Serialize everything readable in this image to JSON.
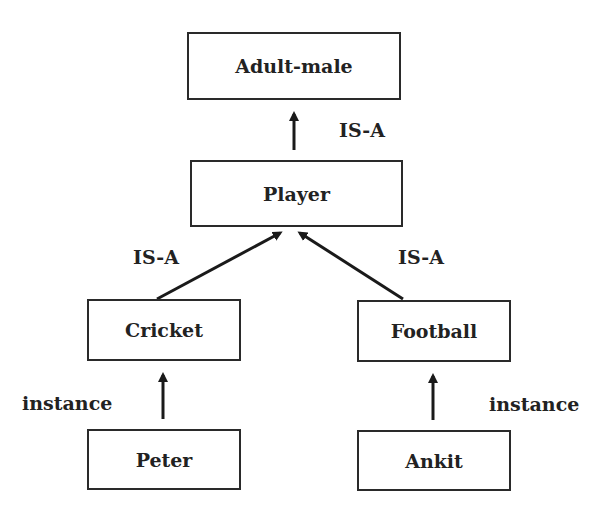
{
  "diagram": {
    "nodes": {
      "adult_male": "Adult-male",
      "player": "Player",
      "cricket": "Cricket",
      "football": "Football",
      "peter": "Peter",
      "ankit": "Ankit"
    },
    "edges": [
      {
        "from": "Player",
        "to": "Adult-male",
        "label": "IS-A"
      },
      {
        "from": "Cricket",
        "to": "Player",
        "label": "IS-A"
      },
      {
        "from": "Football",
        "to": "Player",
        "label": "IS-A"
      },
      {
        "from": "Peter",
        "to": "Cricket",
        "label": "instance"
      },
      {
        "from": "Ankit",
        "to": "Football",
        "label": "instance"
      }
    ],
    "edge_labels": {
      "player_adult": "IS-A",
      "cricket_player": "IS-A",
      "football_player": "IS-A",
      "peter_cricket": "instance",
      "ankit_football": "instance"
    },
    "colors": {
      "stroke": "#2a2a2a",
      "text": "#222222",
      "background": "#ffffff"
    }
  }
}
